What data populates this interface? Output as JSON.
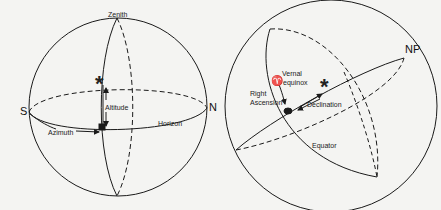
{
  "left_diagram": {
    "title": "Horizontal coordinate system",
    "labels": {
      "zenith": "Zenith",
      "south": "S",
      "north": "N",
      "altitude": "Altitude",
      "azimuth": "Azimuth",
      "horizon": "Horizon"
    },
    "star_symbol": "*"
  },
  "right_diagram": {
    "title": "Equatorial coordinate system",
    "labels": {
      "north_pole": "NP",
      "vernal": "Vernal",
      "equinox": "equinox",
      "vernal_symbol": "♈",
      "right": "Right",
      "ascension": "Ascension",
      "declination": "Declination",
      "equator": "Equator"
    },
    "star_symbol": "*"
  },
  "colors": {
    "line": "#1a1a1a",
    "background": "#f4f4f2"
  }
}
